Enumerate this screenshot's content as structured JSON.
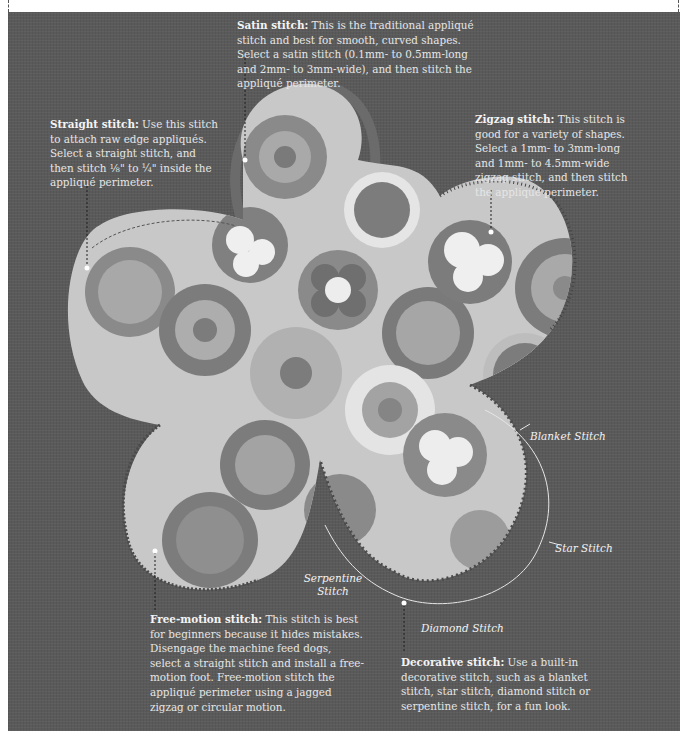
{
  "header": {
    "partial_text": "…stitching methods … the machine …for sewing the … appliqué perimeter …"
  },
  "colors": {
    "background": "#5a5a5a",
    "fabric_base": "#c8c8c8",
    "fabric_dark": "#7c7c7c",
    "fabric_mid": "#a4a4a4",
    "fabric_light": "#e6e6e6",
    "satin_edge": "#6b6b6b",
    "text": "#e6e6e6",
    "leader": "#1e1e1e"
  },
  "callouts": {
    "satin": {
      "title": "Satin stitch:",
      "body": " This is the traditional appliqué stitch and best for smooth, curved shapes. Select a satin stitch (0.1mm- to 0.5mm-long and 2mm- to 3mm-wide), and then stitch the appliqué perimeter."
    },
    "straight": {
      "title": "Straight stitch:",
      "body": " Use this stitch to attach raw edge appliqués. Select a straight stitch, and then stitch ⅛\" to ¼\" inside the appliqué perimeter."
    },
    "zigzag": {
      "title": "Zigzag stitch:",
      "body": " This stitch is good for a variety of shapes. Select a 1mm- to 3mm-long and 1mm- to 4.5mm-wide zigzag stitch, and then stitch the appliqué perimeter."
    },
    "free_motion": {
      "title": "Free-motion stitch:",
      "body": " This stitch is best for beginners because it hides mistakes. Disengage the machine feed dogs, select a straight stitch and install a free-motion foot. Free-motion stitch the appliqué perimeter using a jagged zigzag or circular motion."
    },
    "decorative": {
      "title": "Decorative stitch:",
      "body": " Use a built-in decorative stitch, such as a blanket stitch, star stitch, diamond stitch or serpentine stitch, for a fun look."
    }
  },
  "decorative_labels": {
    "blanket": "Blanket Stitch",
    "star": "Star Stitch",
    "diamond": "Diamond Stitch",
    "serpentine_line1": "Serpentine",
    "serpentine_line2": "Stitch"
  }
}
